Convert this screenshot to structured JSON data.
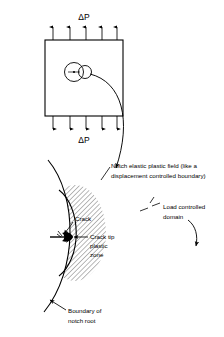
{
  "figure": {
    "title": "",
    "specimen": {
      "load_top_label": "ΔP",
      "load_bottom_label": "ΔP",
      "arrow_count_top": 5,
      "arrow_count_bottom": 5,
      "notch_marker": "notch-with-crack"
    },
    "labels": {
      "notch_field_line1": "Notch elastic plastic field (like a",
      "notch_field_line2": "displacement controlled boundary)",
      "load_domain_line1": "Load controlled",
      "load_domain_line2": "domain",
      "crack": "Crack",
      "crack_tip_line1": "Crack tip",
      "crack_tip_line2": "plastic",
      "crack_tip_line3": "zone",
      "boundary_line1": "Boundary of",
      "boundary_line2": "notch root"
    },
    "colors": {
      "stroke": "#000000",
      "hatch": "#000000",
      "background": "#ffffff"
    }
  }
}
